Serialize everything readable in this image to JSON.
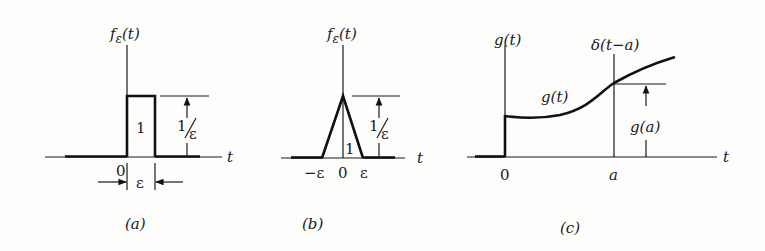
{
  "panels": {
    "a": {
      "caption": "(a)",
      "ylabel_f": "f",
      "ylabel_sub": "ε",
      "ylabel_arg": "(t)",
      "xlabel": "t",
      "area_label": "1",
      "height_num": "1",
      "height_den": "ε",
      "origin_label": "0",
      "width_label": "ε"
    },
    "b": {
      "caption": "(b)",
      "ylabel_f": "f",
      "ylabel_sub": "ε",
      "ylabel_arg": "(t)",
      "xlabel": "t",
      "area_label": "1",
      "height_num": "1",
      "height_den": "ε",
      "tick_neg": "−ε",
      "tick_zero": "0",
      "tick_pos": "ε"
    },
    "c": {
      "caption": "(c)",
      "ylabel": "g(t)",
      "delta_label": "δ(t−a)",
      "curve_label": "g(t)",
      "value_label": "g(a)",
      "xlabel": "t",
      "tick_zero": "0",
      "tick_a": "a"
    }
  }
}
